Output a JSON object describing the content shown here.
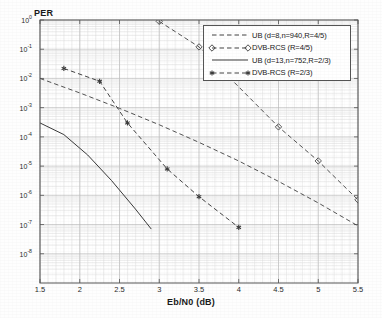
{
  "chart_data": {
    "type": "line",
    "title": "",
    "xlabel": "Eb/N0 (dB)",
    "ylabel": "PER",
    "ylabel_position": "top-left",
    "xlim": [
      1.5,
      5.5
    ],
    "ylim": [
      1e-09,
      1
    ],
    "yscale": "log",
    "xscale": "linear",
    "grid": true,
    "grid_minor": true,
    "legend_position": "top-right",
    "xticks": [
      "1.5",
      "2",
      "2.5",
      "3",
      "3.5",
      "4",
      "4.5",
      "5",
      "5.5"
    ],
    "xtick_values": [
      1.5,
      2,
      2.5,
      3,
      3.5,
      4,
      4.5,
      5,
      5.5
    ],
    "yticks": [
      "10^0",
      "10^-1",
      "10^-2",
      "10^-3",
      "10^-4",
      "10^-5",
      "10^-6",
      "10^-7",
      "10^-8"
    ],
    "ytick_mantissa": [
      "10",
      "10",
      "10",
      "10",
      "10",
      "10",
      "10",
      "10",
      "10"
    ],
    "ytick_exponents": [
      "0",
      "-1",
      "-2",
      "-3",
      "-4",
      "-5",
      "-6",
      "-7",
      "-8"
    ],
    "ytick_values": [
      1,
      0.1,
      0.01,
      0.001,
      0.0001,
      1e-05,
      1e-06,
      1e-07,
      1e-08
    ],
    "series": [
      {
        "name": "UB (d=8,n=940,R=4/5)",
        "style": "dashed",
        "marker": "none",
        "color": "#4a4a4a",
        "x": [
          1.5,
          2.0,
          2.5,
          3.0,
          3.5,
          4.0,
          4.5,
          5.0,
          5.5
        ],
        "y": [
          0.01,
          0.0032,
          0.00095,
          0.00026,
          6.5e-05,
          1.5e-05,
          3e-06,
          5.5e-07,
          9e-08
        ]
      },
      {
        "name": "DVB-RCS (R=4/5)",
        "style": "dashed",
        "marker": "diamond",
        "color": "#4a4a4a",
        "x": [
          3.0,
          3.5,
          4.5,
          5.0,
          5.5
        ],
        "y": [
          0.9,
          0.12,
          0.00022,
          1.5e-05,
          7e-07
        ]
      },
      {
        "name": "UB (d=13,n=752,R=2/3)",
        "style": "solid",
        "marker": "none",
        "color": "#3a3a3a",
        "x": [
          1.5,
          1.8,
          2.1,
          2.4,
          2.7,
          2.9
        ],
        "y": [
          0.0003,
          0.00012,
          2.4e-05,
          3.2e-06,
          3.4e-07,
          7e-08
        ]
      },
      {
        "name": "DVB-RCS (R=2/3)",
        "style": "dashed",
        "marker": "asterisk",
        "color": "#3a3a3a",
        "x": [
          1.8,
          2.25,
          2.6,
          3.1,
          3.5,
          4.0
        ],
        "y": [
          0.022,
          0.008,
          0.0003,
          8e-06,
          9e-07,
          8e-08
        ]
      }
    ]
  },
  "legend": {
    "entries": [
      {
        "label": "UB (d=8,n=940,R=4/5)",
        "marker": "none",
        "style": "dashed"
      },
      {
        "label": "DVB-RCS (R=4/5)",
        "marker": "diamond",
        "style": "dashed"
      },
      {
        "label": "UB (d=13,n=752,R=2/3)",
        "marker": "none",
        "style": "solid"
      },
      {
        "label": "DVB-RCS (R=2/3)",
        "marker": "asterisk",
        "style": "dashed"
      }
    ]
  },
  "axes": {
    "xlabel": "Eb/N0 (dB)",
    "ylabel": "PER"
  },
  "colors": {
    "axis": "#555555",
    "grid_major": "#bfbfbf",
    "grid_minor": "#dcdcdc",
    "curve": "#3a3a3a",
    "background": "#ffffff"
  }
}
